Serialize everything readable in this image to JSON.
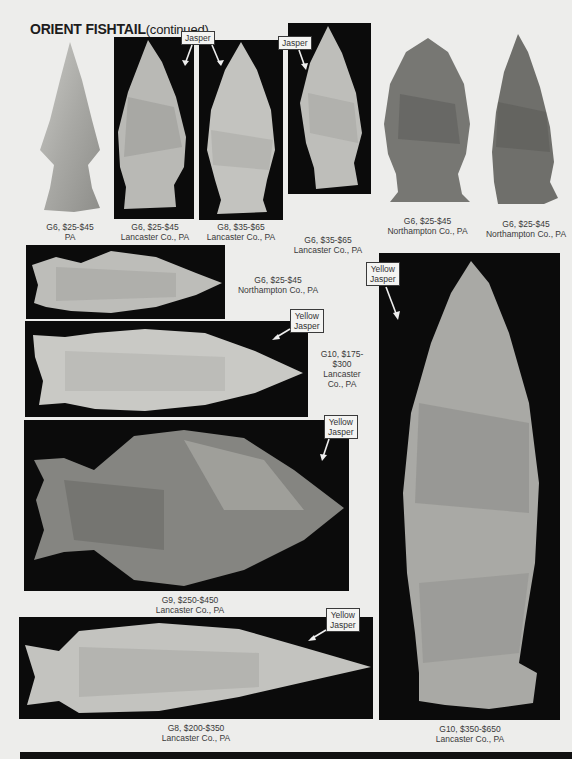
{
  "page": {
    "title": "ORIENT FISHTAIL",
    "title_suffix": "(continued)"
  },
  "colors": {
    "background": "#ededeb",
    "photo_background": "#0b0b0b",
    "stone_light": "#cfcfcb",
    "stone_dark": "#6e6e6a"
  },
  "specimens": [
    {
      "id": 1,
      "grade": "G6, $25-$45",
      "location": "PA",
      "material_tag": []
    },
    {
      "id": 2,
      "grade": "G6, $25-$45",
      "location": "Lancaster Co., PA",
      "material_tag": [
        "Jasper"
      ]
    },
    {
      "id": 3,
      "grade": "G8, $35-$65",
      "location": "Lancaster Co., PA",
      "material_tag": []
    },
    {
      "id": 4,
      "grade": "G6, $35-$65",
      "location": "Lancaster Co., PA",
      "material_tag": [
        "Jasper"
      ]
    },
    {
      "id": 5,
      "grade": "G6, $25-$45",
      "location": "Northampton Co., PA",
      "material_tag": []
    },
    {
      "id": 6,
      "grade": "G6, $25-$45",
      "location": "Northampton Co., PA",
      "material_tag": []
    },
    {
      "id": 7,
      "grade": "G6, $25-$45",
      "location": "Northampton Co., PA",
      "material_tag": []
    },
    {
      "id": 8,
      "grade": "G10, $175-",
      "grade_line2": "$300",
      "location": "Lancaster",
      "location_line2": "Co., PA",
      "material_tag": [
        "Yellow",
        "Jasper"
      ]
    },
    {
      "id": 9,
      "grade": "G9, $250-$450",
      "location": "Lancaster Co., PA",
      "material_tag": [
        "Yellow",
        "Jasper"
      ]
    },
    {
      "id": 10,
      "grade": "G8, $200-$350",
      "location": "Lancaster Co., PA",
      "material_tag": [
        "Yellow",
        "Jasper"
      ]
    },
    {
      "id": 11,
      "grade": "G10, $350-$650",
      "location": "Lancaster Co., PA",
      "material_tag": [
        "Yellow",
        "Jasper"
      ]
    }
  ],
  "shared_tags": {
    "jasper_2_3": "Jasper"
  }
}
